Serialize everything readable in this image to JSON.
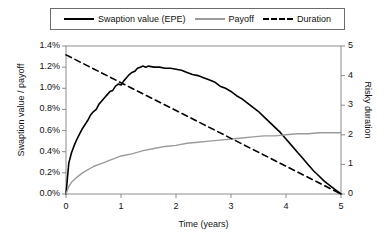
{
  "legend": {
    "position": "top",
    "border_color": "#6b6b6b",
    "entries": [
      {
        "label": "Swaption value (EPE)",
        "style": "solid",
        "color": "#000000",
        "icon": "line-solid-black-icon"
      },
      {
        "label": "Payoff",
        "style": "solid",
        "color": "#9b9b9b",
        "icon": "line-solid-gray-icon"
      },
      {
        "label": "Duration",
        "style": "dashed",
        "color": "#000000",
        "icon": "line-dashed-black-icon"
      }
    ]
  },
  "axes": {
    "x_label": "Time (years)",
    "y_left_label": "Swaption value / payoff",
    "y_right_label": "Risky duration",
    "x_ticks": [
      "0",
      "1",
      "2",
      "3",
      "4",
      "5"
    ],
    "y_left_ticks": [
      "0.0%",
      "0.2%",
      "0.4%",
      "0.6%",
      "0.8%",
      "1.0%",
      "1.2%",
      "1.4%"
    ],
    "y_right_ticks": [
      "0",
      "1",
      "2",
      "3",
      "4",
      "5"
    ]
  },
  "chart_data": {
    "type": "line",
    "title": "",
    "subtitle": "",
    "xlabel": "Time (years)",
    "ylabel": "Swaption value / payoff",
    "y2label": "Risky duration",
    "xlim": [
      0,
      5
    ],
    "ylim": [
      0,
      0.014
    ],
    "y2lim": [
      0,
      5
    ],
    "grid": false,
    "legend_position": "top",
    "x_ticks": [
      0,
      1,
      2,
      3,
      4,
      5
    ],
    "y_ticks": [
      0.0,
      0.002,
      0.004,
      0.006,
      0.008,
      0.01,
      0.012,
      0.014
    ],
    "y_tick_labels": [
      "0.0%",
      "0.2%",
      "0.4%",
      "0.6%",
      "0.8%",
      "1.0%",
      "1.2%",
      "1.4%"
    ],
    "y2_ticks": [
      0,
      1,
      2,
      3,
      4,
      5
    ],
    "series": [
      {
        "name": "Swaption value (EPE)",
        "axis": "left",
        "color": "#000000",
        "style": "solid",
        "width": 1.6,
        "x": [
          0.0,
          0.05,
          0.1,
          0.15,
          0.2,
          0.25,
          0.3,
          0.35,
          0.4,
          0.45,
          0.5,
          0.55,
          0.6,
          0.65,
          0.7,
          0.75,
          0.8,
          0.85,
          0.9,
          0.95,
          1.0,
          1.05,
          1.1,
          1.15,
          1.2,
          1.25,
          1.3,
          1.35,
          1.4,
          1.45,
          1.5,
          1.6,
          1.7,
          1.8,
          1.9,
          2.0,
          2.1,
          2.2,
          2.3,
          2.4,
          2.5,
          2.6,
          2.7,
          2.8,
          2.9,
          3.0,
          3.1,
          3.2,
          3.3,
          3.4,
          3.5,
          3.6,
          3.7,
          3.8,
          3.9,
          4.0,
          4.1,
          4.2,
          4.3,
          4.4,
          4.5,
          4.6,
          4.7,
          4.8,
          4.9,
          5.0
        ],
        "y": [
          0.0,
          0.0029,
          0.0039,
          0.0046,
          0.0052,
          0.0057,
          0.0062,
          0.0066,
          0.007,
          0.0075,
          0.0078,
          0.008,
          0.0085,
          0.0088,
          0.0091,
          0.0094,
          0.0097,
          0.0098,
          0.0102,
          0.0104,
          0.0103,
          0.0107,
          0.011,
          0.0113,
          0.0115,
          0.0116,
          0.0119,
          0.012,
          0.0121,
          0.012,
          0.0121,
          0.012,
          0.012,
          0.0119,
          0.0119,
          0.0118,
          0.0117,
          0.0115,
          0.0113,
          0.0112,
          0.011,
          0.0108,
          0.0106,
          0.0102,
          0.01,
          0.0097,
          0.0093,
          0.009,
          0.0086,
          0.0082,
          0.0078,
          0.0073,
          0.0068,
          0.0063,
          0.0058,
          0.0052,
          0.0046,
          0.004,
          0.0034,
          0.0028,
          0.0022,
          0.0017,
          0.0012,
          0.0008,
          0.0004,
          0.0
        ]
      },
      {
        "name": "Payoff",
        "axis": "left",
        "color": "#9b9b9b",
        "style": "solid",
        "width": 1.4,
        "x": [
          0.0,
          0.05,
          0.1,
          0.2,
          0.3,
          0.4,
          0.5,
          0.6,
          0.7,
          0.8,
          0.9,
          1.0,
          1.2,
          1.4,
          1.6,
          1.8,
          2.0,
          2.2,
          2.4,
          2.6,
          2.8,
          3.0,
          3.2,
          3.4,
          3.6,
          3.8,
          4.0,
          4.2,
          4.4,
          4.6,
          4.8,
          5.0
        ],
        "y": [
          0.0,
          0.0007,
          0.0011,
          0.0016,
          0.002,
          0.0023,
          0.0026,
          0.0028,
          0.003,
          0.0032,
          0.0034,
          0.0036,
          0.0038,
          0.0041,
          0.0043,
          0.0045,
          0.0046,
          0.0048,
          0.0049,
          0.005,
          0.0051,
          0.0052,
          0.0053,
          0.0054,
          0.0055,
          0.0055,
          0.0056,
          0.0057,
          0.0057,
          0.0058,
          0.0058,
          0.0058
        ]
      },
      {
        "name": "Duration",
        "axis": "right",
        "color": "#000000",
        "style": "dashed",
        "width": 1.6,
        "x": [
          0.0,
          5.0
        ],
        "y": [
          4.7,
          0.0
        ]
      }
    ],
    "annotations": []
  }
}
